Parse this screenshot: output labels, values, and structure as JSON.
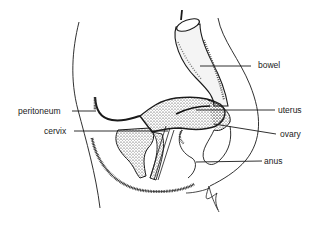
{
  "diagram": {
    "type": "anatomical-cross-section",
    "line_color": "#1a1a1a",
    "background": "#ffffff",
    "labels": [
      {
        "id": "bowel",
        "text": "bowel",
        "x": 258,
        "y": 60
      },
      {
        "id": "peritoneum",
        "text": "peritoneum",
        "x": 18,
        "y": 107
      },
      {
        "id": "uterus",
        "text": "uterus",
        "x": 278,
        "y": 106
      },
      {
        "id": "cervix",
        "text": "cervix",
        "x": 44,
        "y": 127
      },
      {
        "id": "ovary",
        "text": "ovary",
        "x": 280,
        "y": 130
      },
      {
        "id": "anus",
        "text": "anus",
        "x": 264,
        "y": 157
      }
    ]
  }
}
